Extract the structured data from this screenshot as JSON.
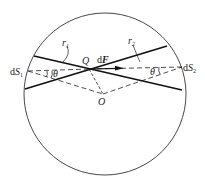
{
  "diagram": {
    "type": "geometry",
    "labels": {
      "r1": "r",
      "r1_sub": "1",
      "r2": "r",
      "r2_sub": "2",
      "Q": "Q",
      "dF_d": "d",
      "dF_F": "F",
      "O": "O",
      "dS1_d": "d",
      "dS1_S": "S",
      "dS1_sub": "1",
      "dS2_d": "d",
      "dS2_S": "S",
      "dS2_sub": "2",
      "theta1": "θ",
      "theta2": "θ"
    },
    "colors": {
      "stroke": "#222222",
      "background": "#ffffff"
    }
  }
}
